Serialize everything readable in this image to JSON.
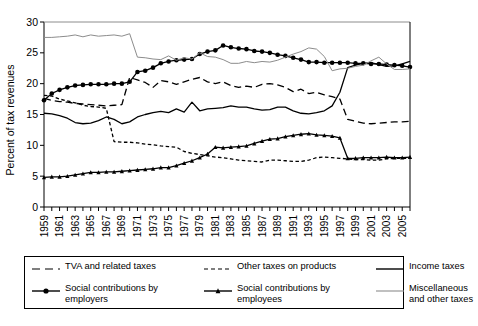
{
  "chart_data": {
    "type": "line",
    "title": "",
    "xlabel": "",
    "ylabel": "Percent of tax revenues",
    "ylim": [
      0,
      30
    ],
    "yticks": [
      0,
      5,
      10,
      15,
      20,
      25,
      30
    ],
    "xlim": [
      1959,
      2006
    ],
    "grid": false,
    "legend_position": "bottom",
    "x": [
      1959,
      1960,
      1961,
      1962,
      1963,
      1964,
      1965,
      1966,
      1967,
      1968,
      1969,
      1970,
      1971,
      1972,
      1973,
      1974,
      1975,
      1976,
      1977,
      1978,
      1979,
      1980,
      1981,
      1982,
      1983,
      1984,
      1985,
      1986,
      1987,
      1988,
      1989,
      1990,
      1991,
      1992,
      1993,
      1994,
      1995,
      1996,
      1997,
      1998,
      1999,
      2000,
      2001,
      2002,
      2003,
      2004,
      2005,
      2006
    ],
    "xtick_labels": [
      "1959",
      "1961",
      "1963",
      "1965",
      "1967",
      "1969",
      "1971",
      "1973",
      "1975",
      "1977",
      "1979",
      "1981",
      "1983",
      "1985",
      "1987",
      "1989",
      "1991",
      "1993",
      "1995",
      "1997",
      "1999",
      "2001",
      "2003",
      "2005"
    ],
    "series": [
      {
        "name": "TVA and related taxes",
        "style": "long-dash",
        "color": "#000000",
        "marker": "none",
        "values": [
          17.6,
          17.3,
          17.1,
          17.0,
          16.8,
          16.7,
          16.6,
          16.5,
          16.4,
          16.5,
          16.6,
          21.0,
          20.6,
          20.2,
          19.4,
          20.5,
          20.3,
          19.9,
          20.3,
          20.7,
          21.0,
          20.3,
          20.0,
          20.3,
          19.7,
          19.4,
          19.6,
          19.4,
          19.9,
          20.0,
          19.8,
          19.4,
          18.7,
          19.1,
          18.4,
          18.6,
          18.2,
          17.9,
          17.5,
          14.2,
          13.9,
          13.6,
          13.5,
          13.6,
          13.7,
          13.8,
          13.8,
          13.9
        ]
      },
      {
        "name": "Other taxes on products",
        "style": "short-dash",
        "color": "#000000",
        "marker": "none",
        "values": [
          18.1,
          18.0,
          17.5,
          17.2,
          16.9,
          16.5,
          16.3,
          16.2,
          16.0,
          10.6,
          10.5,
          10.5,
          10.4,
          10.2,
          10.1,
          9.9,
          9.8,
          9.7,
          9.0,
          8.7,
          8.5,
          8.3,
          8.1,
          8.0,
          7.8,
          7.6,
          7.5,
          7.4,
          7.3,
          7.6,
          7.6,
          7.5,
          7.4,
          7.4,
          7.6,
          8.0,
          8.1,
          8.0,
          7.9,
          7.8,
          7.7,
          7.7,
          7.6,
          7.6,
          7.8,
          7.9,
          7.9,
          7.9
        ]
      },
      {
        "name": "Income taxes",
        "style": "solid",
        "color": "#000000",
        "marker": "none",
        "values": [
          15.2,
          15.1,
          14.8,
          14.4,
          13.7,
          13.5,
          13.6,
          14.0,
          14.6,
          14.2,
          13.5,
          13.8,
          14.6,
          15.0,
          15.3,
          15.5,
          15.3,
          15.9,
          15.4,
          17.0,
          15.6,
          15.9,
          16.0,
          16.1,
          16.4,
          16.2,
          16.2,
          15.9,
          15.7,
          15.8,
          16.2,
          16.2,
          15.6,
          15.2,
          15.1,
          15.3,
          15.6,
          16.4,
          18.6,
          22.6,
          23.0,
          23.3,
          23.4,
          23.1,
          22.8,
          22.9,
          23.2,
          23.6
        ]
      },
      {
        "name": "Social contributions by employers",
        "style": "solid",
        "color": "#000000",
        "marker": "circle",
        "values": [
          17.3,
          18.4,
          19.0,
          19.4,
          19.7,
          19.8,
          19.9,
          19.9,
          19.9,
          20.0,
          20.0,
          20.3,
          21.9,
          22.1,
          22.6,
          23.3,
          23.6,
          23.8,
          23.9,
          24.0,
          24.8,
          25.2,
          25.4,
          26.2,
          25.9,
          25.7,
          25.6,
          25.3,
          25.2,
          25.0,
          24.7,
          24.5,
          24.2,
          23.9,
          23.5,
          23.5,
          23.4,
          23.4,
          23.4,
          23.4,
          23.3,
          23.3,
          23.2,
          23.2,
          23.1,
          23.0,
          22.9,
          22.7
        ]
      },
      {
        "name": "Social contributions by employees",
        "style": "solid",
        "color": "#000000",
        "marker": "cross",
        "values": [
          4.8,
          4.9,
          4.9,
          5.0,
          5.2,
          5.4,
          5.6,
          5.6,
          5.7,
          5.7,
          5.8,
          5.9,
          6.0,
          6.1,
          6.2,
          6.4,
          6.4,
          6.7,
          7.1,
          7.5,
          8.0,
          8.6,
          9.7,
          9.6,
          9.7,
          9.8,
          9.9,
          10.3,
          10.7,
          11.0,
          11.1,
          11.4,
          11.6,
          11.8,
          11.9,
          11.7,
          11.6,
          11.5,
          11.2,
          7.9,
          7.9,
          8.0,
          8.0,
          8.0,
          8.1,
          8.0,
          8.0,
          8.1
        ]
      },
      {
        "name": "Miscellaneous and other taxes",
        "style": "solid-thin",
        "color": "#8c8c8c",
        "marker": "none",
        "values": [
          27.5,
          27.5,
          27.6,
          27.7,
          27.9,
          27.6,
          27.9,
          27.7,
          27.8,
          27.9,
          27.7,
          28.1,
          24.3,
          24.2,
          24.0,
          23.9,
          24.5,
          23.8,
          24.2,
          24.0,
          25.0,
          24.4,
          24.3,
          23.9,
          23.3,
          23.3,
          23.6,
          23.4,
          23.6,
          23.5,
          23.8,
          24.3,
          24.8,
          25.2,
          25.8,
          25.6,
          24.4,
          22.1,
          22.4,
          22.5,
          22.8,
          23.0,
          23.7,
          24.3,
          23.2,
          22.3,
          22.3,
          22.4
        ]
      }
    ]
  },
  "legend": {
    "entries": [
      {
        "label": "TVA and related taxes",
        "icon": "long-dash-swatch-icon"
      },
      {
        "label": "Other taxes on products",
        "icon": "short-dash-swatch-icon"
      },
      {
        "label": "Income taxes",
        "icon": "solid-line-swatch-icon"
      },
      {
        "label": "Social contributions by\nemployers",
        "icon": "circle-marker-swatch-icon"
      },
      {
        "label": "Social contributions by\nemployees",
        "icon": "cross-marker-swatch-icon"
      },
      {
        "label": "Miscellaneous\nand other taxes",
        "icon": "gray-line-swatch-icon"
      }
    ]
  },
  "axes": {
    "ylabel": "Percent of tax revenues"
  }
}
